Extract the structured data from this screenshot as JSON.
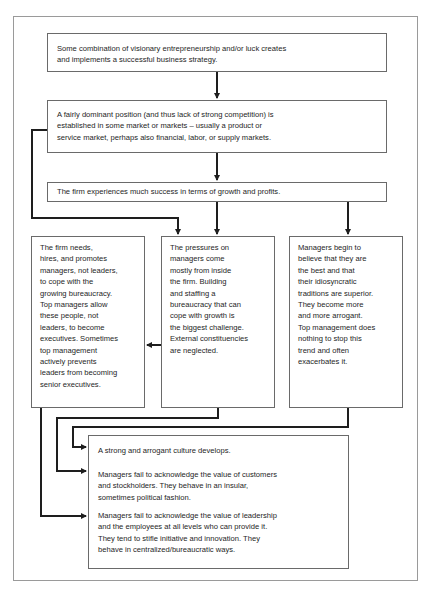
{
  "diagram": {
    "type": "flowchart",
    "boxes": {
      "strategy": {
        "lines": [
          "Some combination of visionary entrepreneurship and/or luck creates",
          "and implements a successful business strategy."
        ]
      },
      "dominant_position": {
        "lines": [
          "A fairly dominant position (and thus lack of strong competition) is",
          "established in some market or markets – usually a product or",
          "service market, perhaps also financial, labor, or supply markets."
        ]
      },
      "success": {
        "lines": [
          "The firm experiences much success in terms of growth and profits."
        ]
      },
      "managers_not_leaders": {
        "lines": [
          "The firm needs,",
          "hires, and promotes",
          "managers, not leaders,",
          "to cope with the",
          "growing bureaucracy.",
          "Top managers allow",
          "these people, not",
          "leaders, to become",
          "executives. Sometimes",
          "top management",
          "actively prevents",
          "leaders from becoming",
          "senior executives."
        ]
      },
      "internal_pressures": {
        "lines": [
          "The pressures on",
          "managers come",
          "mostly from inside",
          "the firm. Building",
          "and staffing a",
          "bureaucracy that can",
          "cope with growth is",
          "the biggest challenge.",
          "External constituencies",
          "are neglected."
        ]
      },
      "arrogance": {
        "lines": [
          "Managers begin to",
          "believe that they are",
          "the best and that",
          "their idiosyncratic",
          "traditions are superior.",
          "They become more",
          "and more arrogant.",
          "Top management does",
          "nothing to stop this",
          "trend and often",
          "exacerbates it."
        ]
      },
      "outcomes": {
        "paragraphs": [
          {
            "lines": [
              "A strong and arrogant culture develops."
            ]
          },
          {
            "lines": [
              "Managers fail to acknowledge the value of customers",
              "and stockholders. They behave in an insular,",
              "sometimes political fashion."
            ]
          },
          {
            "lines": [
              "Managers fail to acknowledge the value of leadership",
              "and the employees at all levels who can provide it.",
              "They tend to stifle initiative and innovation. They",
              "behave in centralized/bureaucratic ways."
            ]
          }
        ]
      }
    },
    "caption_partially_visible": true,
    "caption_note": "Caption below frame is cut off at image bottom edge; only tops of letters visible, text not legible."
  },
  "colors": {
    "line": "#1e1e1e",
    "box_border": "#6a6a6a",
    "frame_border": "#9a9a9a",
    "background": "#ffffff"
  }
}
